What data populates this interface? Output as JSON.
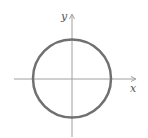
{
  "diagram": {
    "type": "circle-on-axes",
    "axes": {
      "x_label": "x",
      "y_label": "y",
      "color": "#9a9a9a"
    },
    "circle": {
      "center": [
        72,
        78.5
      ],
      "radius": 39,
      "stroke": "#707070",
      "stroke_width": 2.5
    }
  }
}
